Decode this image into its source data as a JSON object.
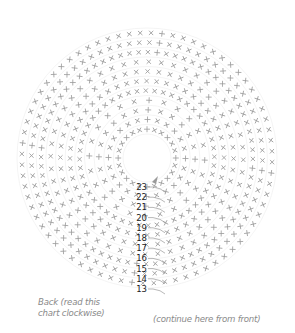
{
  "diagram": {
    "type": "crochet-round-chart",
    "center": [
      147,
      158
    ],
    "hole_radius": 14,
    "outer_radius": 130,
    "rounds": [
      13,
      14,
      15,
      16,
      17,
      18,
      19,
      20,
      21,
      22,
      23
    ],
    "round_labels": [
      "13",
      "14",
      "15",
      "16",
      "17",
      "18",
      "19",
      "20",
      "21",
      "22",
      "23"
    ],
    "spokes": 24,
    "stitch_symbols": {
      "spoke_stitch": "plus",
      "body_stitch": "x"
    },
    "colors": {
      "stitch": "#9a9a9a",
      "ring": "#ececec",
      "label": "#222222",
      "join_line": "#9a9a9a",
      "caption": "#8a8a8a"
    }
  },
  "captions": {
    "back_line1": "Back (read this",
    "back_line2": "chart clockwise)",
    "front": "(continue here from front)"
  }
}
